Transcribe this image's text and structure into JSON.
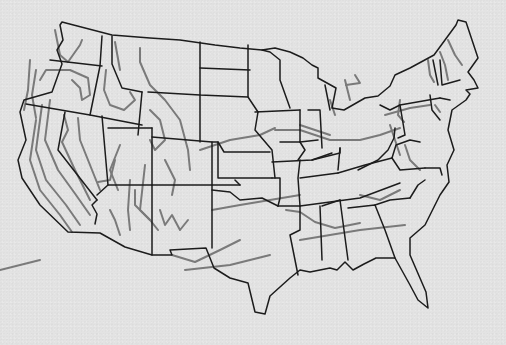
{
  "map": {
    "subject": "Contiguous United States outline map with state borders and contour lines",
    "colors": {
      "background": "#e3e3e3",
      "state_border": "#1c1c1c",
      "contour_line": "#7a7a7a"
    },
    "outline": "M60,25 L63,40 L57,50 L62,64 L52,92 L24,100 L20,112 L26,140 L18,160 L22,178 L40,205 L68,232 L100,233 L125,247 L152,255 L172,255 L170,250 L206,248 L214,268 L230,278 L248,283 L255,312 L265,314 L270,296 L290,278 L300,270 L310,272 L330,268 L337,270 L345,262 L353,270 L364,264 L376,258 L395,258 L410,285 L418,300 L428,308 L426,292 L410,255 L410,238 L425,225 L440,195 L449,182 L447,165 L454,150 L448,130 L452,110 L466,100 L470,94 L466,90 L478,88 L474,80 L468,72 L478,58 L466,22 L458,20 L456,25 L434,55 L410,68 L395,75 L390,86 L378,96 L365,98 L344,110 L332,108 L336,88 L318,78 L318,68 L312,65 L303,58 L290,52 L275,48 L262,50 L240,48 L215,45 L180,40 L150,38 L112,35 L62,22 Z",
    "state_borders": [
      "M50,60 L102,66",
      "M102,36 L100,66 L90,115",
      "M112,36 L112,64 L122,88 L142,92",
      "M142,92 L138,135",
      "M26,104 L90,115 L142,125",
      "M65,112 L58,150 L97,200",
      "M97,200 L92,205 L97,214 L95,224",
      "M102,116 L108,185 L97,195",
      "M108,185 L152,185 L152,255",
      "M108,128 L152,128",
      "M148,92 L200,95 L200,142",
      "M152,128 L152,185",
      "M152,137 L212,142 L212,185",
      "M152,185 L212,185 L240,185",
      "M200,42 L200,95 L248,97",
      "M200,68 L250,70",
      "M248,45 L248,97 L258,112",
      "M212,142 L218,142 L224,152 L270,152",
      "M218,142 L218,178 L272,178",
      "M212,185 L212,248",
      "M212,190 L230,192 L240,200 L262,198 L278,206",
      "M240,185 L235,180",
      "M272,178 L280,178 L280,198 L278,206",
      "M278,206 L300,206 L300,230 L290,235 L298,275",
      "M258,112 L255,130 L272,150 L275,178",
      "M262,50 L270,52 L280,60 L280,80 L290,108",
      "M255,112 L300,110",
      "M300,110 L300,142 L305,150 L298,160",
      "M280,142 L300,142",
      "M300,142 L318,140",
      "M272,162 L312,160 L332,153",
      "M300,160 L298,178 L300,206",
      "M312,160 L340,153 L340,148",
      "M308,110 L320,110 L322,148",
      "M325,85 L330,110",
      "M340,148 L338,170",
      "M338,173 L300,178",
      "M338,173 L365,165 L392,158",
      "M300,206 L360,198 L400,183",
      "M320,206 L322,260",
      "M322,206 L340,200",
      "M340,200 L348,260",
      "M348,208 L375,205 L385,230 L395,258",
      "M375,205 L390,200 L410,198",
      "M358,170 L378,160 L388,150 L394,138 L395,128",
      "M392,158 L396,145 L410,140 L420,142",
      "M392,158 L400,170 L425,168",
      "M380,105 L390,110 L400,105 L440,98",
      "M400,105 L405,135 L398,138",
      "M430,95 L432,110 L440,120",
      "M440,98 L450,100",
      "M440,60 L442,85 L460,80",
      "M433,60 L438,85",
      "M425,168 L440,168 L442,175",
      "M410,198 L418,185 L425,180"
    ],
    "contour_lines": [
      "M36,120 L30,160 L40,190 L60,215 L72,232",
      "M42,105 L36,150 L46,180 L66,205 L80,225",
      "M50,100 L45,140 L58,170 L76,195 L90,215",
      "M30,60 L28,90 L24,110",
      "M36,70 L32,95 L36,118",
      "M40,80 L46,70 L70,70 L88,78 L90,95 L82,100 L80,88 L72,80",
      "M55,30 L60,55 L68,62 L80,45 L82,40",
      "M64,115 L68,130 L62,142 L75,170 L90,200",
      "M78,118 L80,140 L92,170 L100,190",
      "M106,70 L104,90 L110,105 L124,110 L135,100 L130,92",
      "M115,42 L120,70",
      "M140,48 L140,62 L150,85 L165,100 L180,120 L188,150 L190,170",
      "M115,160 L110,180 L98,182",
      "M120,145 L110,170 L118,190",
      "M130,180 L128,210 L130,230",
      "M150,110 L160,120 L165,140 L155,150 L150,140",
      "M145,165 L140,210 L150,220",
      "M165,160 L170,170 L175,180 L172,195",
      "M110,210 L115,220 L120,235",
      "M135,190 L135,205 L150,220 L158,230",
      "M160,210 L165,225 L172,215 L180,230 L188,220",
      "M172,255 L195,262 L220,250 L240,240",
      "M185,270 L230,265 L270,255",
      "M0,270 L40,260",
      "M212,210 L240,205 L270,200 L300,195",
      "M200,150 L215,145 L230,140 L260,135 L275,128",
      "M275,130 L300,130 L330,140 L360,140 L380,135 L400,128",
      "M300,125 L330,135",
      "M286,210 L300,212 L315,222 L335,228 L360,223",
      "M300,240 L330,235 L360,230 L405,225",
      "M360,195 L380,200 L400,190",
      "M405,145 L410,160 L420,170",
      "M390,125 L395,140 L400,155",
      "M385,115 L410,108 L430,105",
      "M346,85 L360,83 L355,75",
      "M330,100 L335,115",
      "M345,80 L350,100",
      "M428,60 L430,75 L434,82",
      "M440,52 L445,65 L448,80",
      "M448,40 L455,55 L462,65",
      "M400,100 L398,115 L404,122",
      "M435,105 L440,112"
    ]
  }
}
